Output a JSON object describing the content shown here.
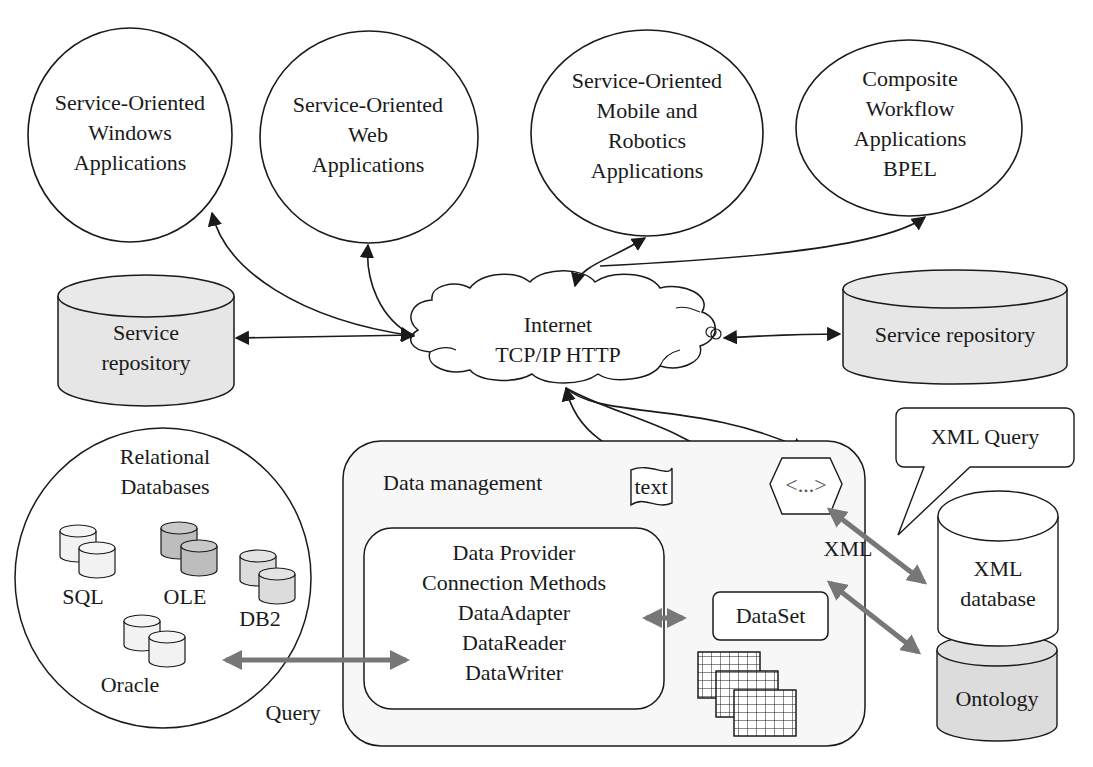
{
  "applications": [
    {
      "id": "windows",
      "lines": [
        "Service-Oriented",
        "Windows",
        "Applications"
      ]
    },
    {
      "id": "web",
      "lines": [
        "Service-Oriented",
        "Web",
        "Applications"
      ]
    },
    {
      "id": "mobile",
      "lines": [
        "Service-Oriented",
        "Mobile and",
        "Robotics",
        "Applications"
      ]
    },
    {
      "id": "workflow",
      "lines": [
        "Composite",
        "Workflow",
        "Applications",
        "BPEL"
      ]
    }
  ],
  "internet": {
    "lines": [
      "Internet",
      "TCP/IP HTTP"
    ]
  },
  "service_repository_left": {
    "lines": [
      "Service",
      "repository"
    ]
  },
  "service_repository_right": {
    "label": "Service repository"
  },
  "relational": {
    "title_lines": [
      "Relational",
      "Databases"
    ],
    "databases": [
      "SQL",
      "OLE",
      "DB2",
      "Oracle"
    ]
  },
  "query_label": "Query",
  "data_management": {
    "title": "Data management",
    "provider_lines": [
      "Data Provider",
      "Connection Methods",
      "DataAdapter",
      "DataReader",
      "DataWriter"
    ],
    "dataset": "DataSet",
    "text_doc": "text",
    "xml_tag": "<...>",
    "xml_label": "XML"
  },
  "xml_query_callout": "XML Query",
  "xml_database": {
    "lines": [
      "XML",
      "database"
    ]
  },
  "ontology": "Ontology",
  "colors": {
    "line": "#1a1a1a",
    "gray_arrow": "#777777",
    "repo_fill": "#e6e6e6",
    "ontology_fill": "#dcdcdc",
    "panel_fill": "#f7f7f7"
  }
}
